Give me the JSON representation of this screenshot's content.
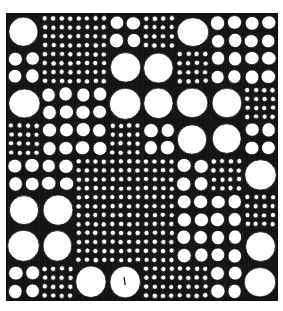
{
  "illustration": {
    "title": "Pen-and-ink pattern of circles in a grid",
    "frame": {
      "x": 7,
      "y": 14,
      "width": 270,
      "height": 286
    },
    "colors": {
      "ink": "#111111",
      "paper": "#ffffff",
      "hatch": "#e8e8e8"
    },
    "grid": {
      "cols": 8,
      "rows": 8,
      "legend": {
        "L": "one large circle per cell",
        "M": "2 x 2 medium circles per cell",
        "S": "4 x 4 small circles per cell"
      },
      "cells": [
        [
          "L",
          "S",
          "S",
          "M",
          "S",
          "L",
          "M",
          "M"
        ],
        [
          "M",
          "S",
          "S",
          "L",
          "L",
          "S",
          "M",
          "M"
        ],
        [
          "L",
          "M",
          "M",
          "L",
          "L",
          "L",
          "L",
          "S"
        ],
        [
          "S",
          "M",
          "M",
          "S",
          "M",
          "L",
          "L",
          "M"
        ],
        [
          "M",
          "M",
          "S",
          "S",
          "S",
          "M",
          "S",
          "L"
        ],
        [
          "L",
          "L",
          "S",
          "S",
          "S",
          "M",
          "M",
          "S"
        ],
        [
          "L",
          "L",
          "S",
          "S",
          "S",
          "M",
          "M",
          "L"
        ],
        [
          "M",
          "S",
          "L",
          "L",
          "S",
          "S",
          "M",
          "L"
        ]
      ]
    }
  }
}
